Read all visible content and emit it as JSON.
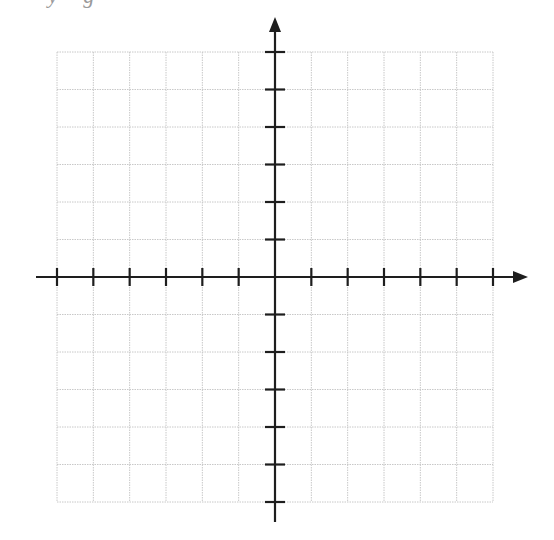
{
  "header": {
    "clipped_text": "y g"
  },
  "diagram": {
    "type": "coordinate-plane",
    "grid": {
      "columns": 12,
      "rows": 12,
      "left": 57,
      "top": 52,
      "right": 493,
      "bottom": 502,
      "line_color": "#c8c8c8",
      "line_style": "dotted"
    },
    "x_axis": {
      "y": 277,
      "start_x": 36,
      "end_x": 528,
      "arrow_right": true,
      "arrow_left": false,
      "ticks_left_of_origin": 6,
      "ticks_right_of_origin": 6,
      "tick_labels": []
    },
    "y_axis": {
      "x": 275,
      "start_y": 17,
      "end_y": 522,
      "arrow_top": true,
      "arrow_bottom": false,
      "ticks_above_origin": 6,
      "ticks_below_origin": 6,
      "tick_labels": []
    },
    "axis_color": "#1e1e1e",
    "origin": {
      "x": 275,
      "y": 277
    }
  }
}
